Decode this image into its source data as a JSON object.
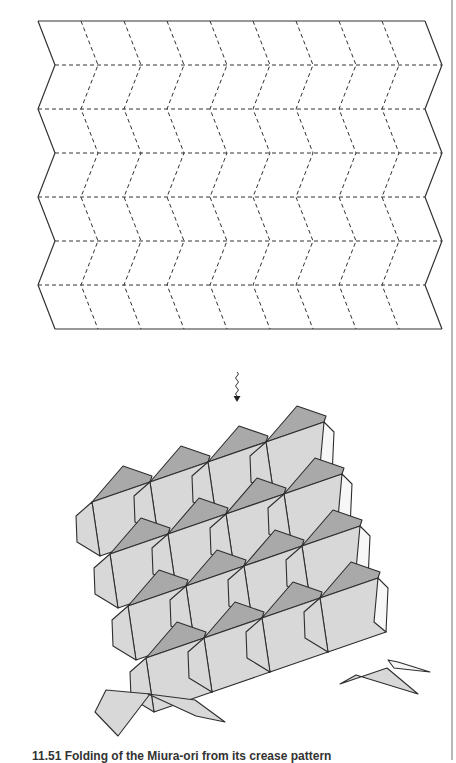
{
  "figure": {
    "crease_pattern": {
      "label": "Miura-ori crease pattern (zig-zag pleats)",
      "rows": 7,
      "columns": 9,
      "top_y": 21,
      "row_height": 44,
      "left_x": 38,
      "col_width": 43,
      "zigzag_offset": 17,
      "stroke_color": "#333333",
      "edge_style": "solid",
      "fold_style": "dashed"
    },
    "transition_arrow": {
      "icon": "squiggle-down-arrow",
      "x": 237,
      "y_top": 372,
      "y_bottom": 402
    },
    "folded_pattern": {
      "label": "Partially folded Miura-ori tessellation",
      "colors": {
        "light_face": "#d8d8d8",
        "dark_face": "#a9a9a9",
        "white_face": "#f7f7f7",
        "edge": "#2e2e2e"
      }
    },
    "caption": {
      "text": "11.51  Folding of the Miura-ori from its crease pattern"
    }
  }
}
